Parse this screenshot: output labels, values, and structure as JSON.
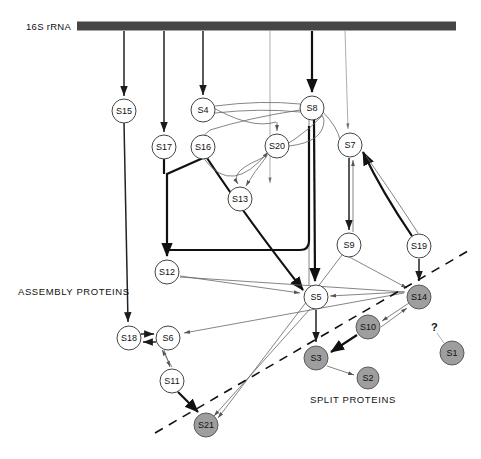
{
  "figure": {
    "title_rrna": "16S rRNA",
    "assembly_label": "ASSEMBLY PROTEINS",
    "split_label": "SPLIT PROTEINS",
    "unknown_marker": "?",
    "colors": {
      "rrna_bar": "#464646",
      "assembly_node_fill": "#ffffff",
      "split_node_fill": "#9e9e9e",
      "node_stroke": "#444444",
      "edge_strong": "#111111",
      "edge_thin": "#8a8a8a",
      "background": "#ffffff"
    }
  },
  "nodes": [
    {
      "id": "S15",
      "label": "S15",
      "x": 124,
      "y": 111,
      "r": 12,
      "group": "assembly"
    },
    {
      "id": "S17",
      "label": "S17",
      "x": 164,
      "y": 147,
      "r": 12,
      "group": "assembly"
    },
    {
      "id": "S16",
      "label": "S16",
      "x": 203,
      "y": 147,
      "r": 12,
      "group": "assembly"
    },
    {
      "id": "S4",
      "label": "S4",
      "x": 203,
      "y": 110,
      "r": 12,
      "group": "assembly"
    },
    {
      "id": "S8",
      "label": "S8",
      "x": 312,
      "y": 108,
      "r": 12,
      "group": "assembly"
    },
    {
      "id": "S20",
      "label": "S20",
      "x": 277,
      "y": 146,
      "r": 12,
      "group": "assembly"
    },
    {
      "id": "S7",
      "label": "S7",
      "x": 350,
      "y": 145,
      "r": 12,
      "group": "assembly"
    },
    {
      "id": "S13",
      "label": "S13",
      "x": 240,
      "y": 199,
      "r": 12,
      "group": "assembly"
    },
    {
      "id": "S9",
      "label": "S9",
      "x": 349,
      "y": 245,
      "r": 12,
      "group": "assembly"
    },
    {
      "id": "S19",
      "label": "S19",
      "x": 419,
      "y": 246,
      "r": 12,
      "group": "assembly"
    },
    {
      "id": "S12",
      "label": "S12",
      "x": 167,
      "y": 272,
      "r": 12,
      "group": "assembly"
    },
    {
      "id": "S5",
      "label": "S5",
      "x": 316,
      "y": 297,
      "r": 12,
      "group": "assembly"
    },
    {
      "id": "S18",
      "label": "S18",
      "x": 129,
      "y": 338,
      "r": 12,
      "group": "assembly"
    },
    {
      "id": "S6",
      "label": "S6",
      "x": 168,
      "y": 338,
      "r": 12,
      "group": "assembly"
    },
    {
      "id": "S11",
      "label": "S11",
      "x": 172,
      "y": 381,
      "r": 12,
      "group": "assembly"
    },
    {
      "id": "S14",
      "label": "S14",
      "x": 419,
      "y": 297,
      "r": 12,
      "group": "split"
    },
    {
      "id": "S10",
      "label": "S10",
      "x": 368,
      "y": 327,
      "r": 12,
      "group": "split"
    },
    {
      "id": "S3",
      "label": "S3",
      "x": 316,
      "y": 358,
      "r": 12,
      "group": "split"
    },
    {
      "id": "S2",
      "label": "S2",
      "x": 368,
      "y": 378,
      "r": 11,
      "group": "split"
    },
    {
      "id": "S1",
      "label": "S1",
      "x": 452,
      "y": 353,
      "r": 12,
      "group": "split"
    },
    {
      "id": "S21",
      "label": "S21",
      "x": 206,
      "y": 425,
      "r": 12,
      "group": "split"
    }
  ],
  "rrna_bar": {
    "x1": 77,
    "x2": 456,
    "y": 26,
    "thickness": 9
  },
  "split_divider": {
    "x1": 155,
    "y1": 433,
    "x2": 468,
    "y2": 251
  },
  "edges_from_rrna": [
    {
      "to": "S15",
      "x": 124,
      "weight": "medium"
    },
    {
      "to": "S17",
      "x": 164,
      "weight": "medium"
    },
    {
      "to": "S4",
      "x": 203,
      "weight": "medium"
    },
    {
      "to": "S13",
      "x": 240,
      "weight": "hair"
    },
    {
      "to": "S8",
      "x": 312,
      "weight": "strong"
    },
    {
      "to": "S7",
      "x": 345,
      "weight": "hair"
    }
  ],
  "edges": [
    {
      "from": "S15",
      "to": "S18",
      "weight": "medium"
    },
    {
      "from": "S17",
      "to": "S12",
      "weight": "strong"
    },
    {
      "from": "S16",
      "to": "S12",
      "weight": "strong"
    },
    {
      "from": "S16",
      "to": "S5",
      "weight": "strong"
    },
    {
      "from": "S4",
      "to": "S20",
      "weight": "thin"
    },
    {
      "from": "S4",
      "to": "S13",
      "weight": "thin"
    },
    {
      "from": "S8",
      "to": "S20",
      "weight": "thin"
    },
    {
      "from": "S8",
      "to": "S13",
      "weight": "thin"
    },
    {
      "from": "S8",
      "to": "S7",
      "weight": "thin"
    },
    {
      "from": "S8",
      "to": "S5",
      "weight": "strong"
    },
    {
      "from": "S20",
      "to": "S13",
      "weight": "thin"
    },
    {
      "from": "S7",
      "to": "S9",
      "weight": "medium"
    },
    {
      "from": "S9",
      "to": "S7",
      "weight": "medium"
    },
    {
      "from": "S19",
      "to": "S7",
      "weight": "strong"
    },
    {
      "from": "S19",
      "to": "S14",
      "weight": "medium"
    },
    {
      "from": "S9",
      "to": "S14",
      "weight": "thin"
    },
    {
      "from": "S9",
      "to": "S21",
      "weight": "thin"
    },
    {
      "from": "S12",
      "to": "S6",
      "weight": "thin"
    },
    {
      "from": "S12",
      "to": "S5",
      "weight": "thin"
    },
    {
      "from": "S5",
      "to": "S3",
      "weight": "medium"
    },
    {
      "from": "S5",
      "to": "S21",
      "weight": "thin"
    },
    {
      "from": "S18",
      "to": "S6",
      "weight": "medium"
    },
    {
      "from": "S6",
      "to": "S18",
      "weight": "medium"
    },
    {
      "from": "S6",
      "to": "S11",
      "weight": "thin"
    },
    {
      "from": "S11",
      "to": "S6",
      "weight": "thin"
    },
    {
      "from": "S11",
      "to": "S21",
      "weight": "strong"
    },
    {
      "from": "S14",
      "to": "S10",
      "weight": "thin"
    },
    {
      "from": "S10",
      "to": "S14",
      "weight": "thin"
    },
    {
      "from": "S10",
      "to": "S3",
      "weight": "strong"
    },
    {
      "from": "S3",
      "to": "S2",
      "weight": "thin"
    },
    {
      "from": "S14",
      "to": "S5",
      "weight": "thin"
    },
    {
      "from": "S1",
      "to": "unknown",
      "weight": "hair"
    }
  ]
}
